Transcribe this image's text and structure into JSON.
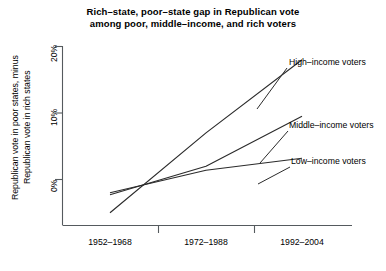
{
  "title": {
    "line1": "Rich–state, poor–state gap in Republican vote",
    "line2": "among poor, middle–income, and rich voters"
  },
  "axes": {
    "ylabel_line1": "Republican vote in poor states, minus",
    "ylabel_line2": "Republican vote in rich states",
    "ytick_labels": [
      "0%",
      "10%",
      "20%"
    ],
    "xtick_labels": [
      "1952–1968",
      "1972–1988",
      "1992–2004"
    ]
  },
  "series_labels": {
    "high": "High–income voters",
    "middle": "Middle–income voters",
    "low": "Low–income voters"
  },
  "chart_data": {
    "type": "line",
    "title": "Rich–state, poor–state gap in Republican vote among poor, middle–income, and rich voters",
    "xlabel": "",
    "ylabel": "Republican vote in poor states, minus Republican vote in rich states",
    "categories": [
      "1952–1968",
      "1972–1988",
      "1992–2004"
    ],
    "ylim": [
      -6,
      21
    ],
    "yticks": [
      0,
      10,
      20
    ],
    "grid": false,
    "legend": "inline-annotations",
    "series": [
      {
        "name": "High–income voters",
        "values": [
          -5.0,
          7.0,
          18.0
        ]
      },
      {
        "name": "Middle–income voters",
        "values": [
          -2.3,
          2.0,
          9.5
        ]
      },
      {
        "name": "Low–income voters",
        "values": [
          -2.0,
          1.4,
          3.2
        ]
      }
    ]
  }
}
